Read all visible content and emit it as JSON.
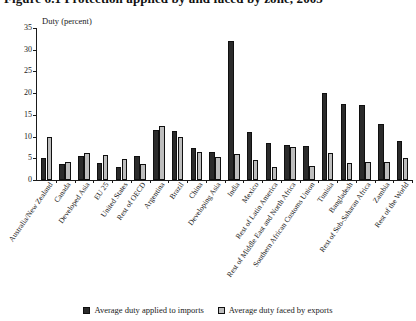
{
  "figure": {
    "title": "Figure 6.1   Protection applied by and faced by zone, 2005"
  },
  "axis": {
    "y_caption": "Duty (percent)",
    "y_ticks": [
      "0",
      "5",
      "10",
      "15",
      "20",
      "25",
      "30",
      "35"
    ]
  },
  "legend": {
    "items": [
      {
        "label": "Average duty applied to imports",
        "swatch": "dark",
        "color": "#2b2b2b"
      },
      {
        "label": "Average duty faced by exports",
        "swatch": "light",
        "color": "#bdbdbd"
      }
    ]
  },
  "chart_data": {
    "type": "bar",
    "title": "Figure 6.1   Protection applied by and faced by zone, 2005",
    "xlabel": "",
    "ylabel": "Duty (percent)",
    "ylim": [
      0,
      35
    ],
    "ytick_step": 5,
    "grid": false,
    "legend_position": "bottom-center",
    "categories": [
      "Australia/New Zealand",
      "Canada",
      "Developed Asia",
      "EU 25",
      "United States",
      "Rest of OECD",
      "Argentina",
      "Brazil",
      "China",
      "Developing Asia",
      "India",
      "Mexico",
      "Rest of Latin America",
      "Rest of Middle East and North Africa",
      "Southern African Customs Union",
      "Tunisia",
      "Bangladesh",
      "Rest of Sub-Saharan Africa",
      "Zambia",
      "Rest of the World"
    ],
    "series": [
      {
        "name": "Average duty applied to imports",
        "color": "#2b2b2b",
        "values": [
          5.0,
          3.6,
          5.5,
          4.0,
          3.0,
          5.5,
          11.5,
          11.3,
          7.3,
          6.4,
          32.0,
          11.0,
          8.5,
          8.0,
          7.8,
          20.0,
          17.5,
          17.2,
          13.0,
          9.0
        ]
      },
      {
        "name": "Average duty faced by exports",
        "color": "#bdbdbd",
        "values": [
          9.8,
          4.2,
          6.3,
          5.8,
          4.8,
          3.6,
          12.5,
          10.0,
          6.5,
          5.3,
          6.0,
          4.5,
          3.0,
          7.5,
          3.2,
          6.3,
          4.0,
          4.2,
          4.2,
          5.0
        ]
      }
    ]
  }
}
